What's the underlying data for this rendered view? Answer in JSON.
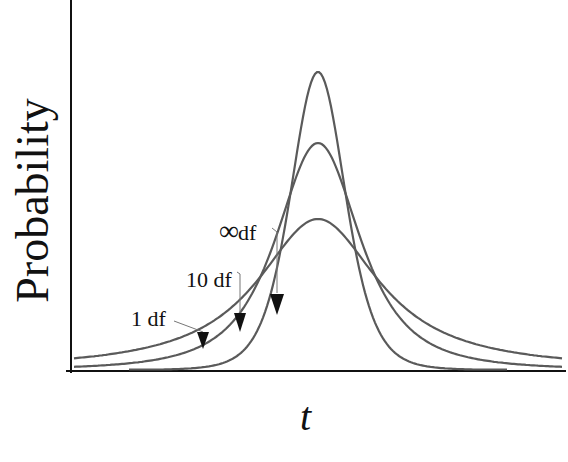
{
  "chart_data": {
    "type": "line",
    "title": "",
    "xlabel": "t",
    "ylabel": "Probability",
    "grid": false,
    "legend": "none (inline annotations with arrows)",
    "x_ticks": [],
    "y_ticks": [],
    "series": [
      {
        "name": "∞ df",
        "label": "∞df",
        "peak_px": [
          318,
          72
        ],
        "half_width_px": 28,
        "tail_px": 90,
        "relative_peak": 1.0
      },
      {
        "name": "10 df",
        "label": "10 df",
        "peak_px": [
          318,
          143
        ],
        "half_width_px": 45,
        "tail_px": 160,
        "relative_peak": 0.76
      },
      {
        "name": "1 df",
        "label": "1 df",
        "peak_px": [
          318,
          219
        ],
        "half_width_px": 72,
        "tail_px": 240,
        "relative_peak": 0.5
      }
    ],
    "annotations": [
      {
        "text": "1 df",
        "text_px": [
          130,
          320
        ],
        "arrow_tip_px": [
          203,
          346
        ]
      },
      {
        "text": "10 df",
        "text_px": [
          186,
          282
        ],
        "arrow_tip_px": [
          240,
          330
        ]
      },
      {
        "text": "∞df",
        "text_px": [
          220,
          232
        ],
        "arrow_tip_px": [
          277,
          313
        ]
      }
    ],
    "curve_color": "#5a5a5a",
    "axis_color": "#111111"
  },
  "labels": {
    "y_axis": "Probability",
    "x_axis": "t",
    "one_df": "1 df",
    "ten_df": "10 df",
    "inf_symbol": "∞",
    "inf_suffix": "df"
  }
}
